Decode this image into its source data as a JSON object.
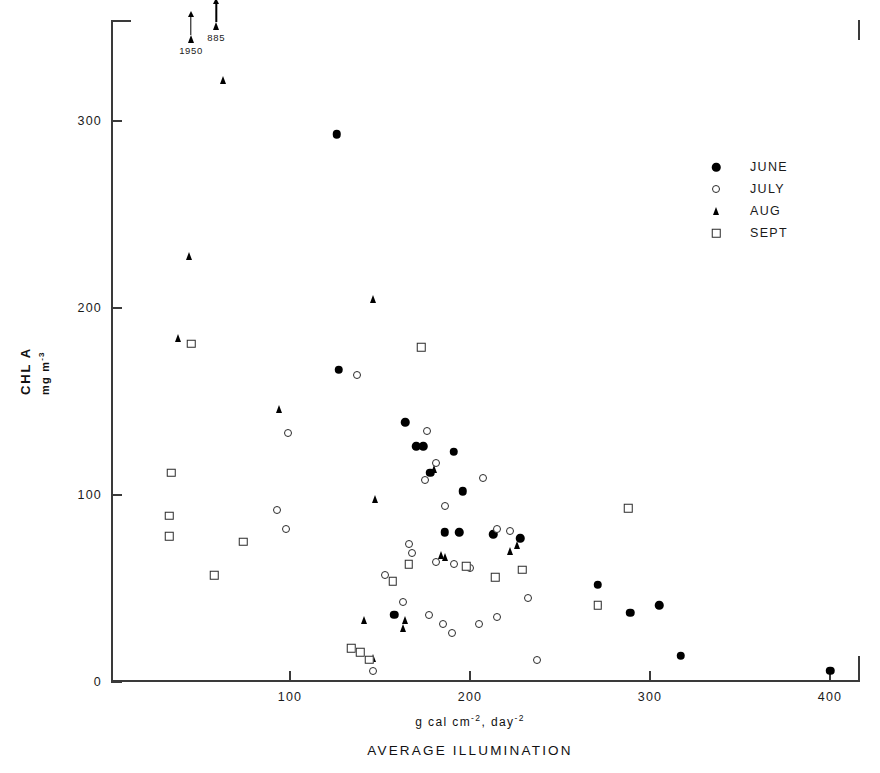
{
  "chart_data": {
    "type": "scatter",
    "title": "AVERAGE ILLUMINATION",
    "xlabel": "g cal cm-2, day-2",
    "xlabel_parts": {
      "prefix": "g  cal  cm",
      "sup1": "-2",
      "mid": ",  day",
      "sup2": "-2"
    },
    "ylabel": "CHL A",
    "ylabel_sub": "mg m-3",
    "ylabel_sub_parts": {
      "prefix": "mg  m",
      "sup": "-3"
    },
    "xlim": [
      0,
      416
    ],
    "ylim": [
      0,
      354
    ],
    "xticks": [
      100,
      200,
      300,
      400
    ],
    "yticks": [
      0,
      100,
      200,
      300
    ],
    "grid": false,
    "legend_position": "upper-right-inside",
    "series": [
      {
        "name": "JUNE",
        "marker": "filled-circle",
        "color": "#000000",
        "points": [
          [
            126,
            293
          ],
          [
            127,
            167
          ],
          [
            164,
            139
          ],
          [
            170,
            126
          ],
          [
            174,
            126
          ],
          [
            178,
            112
          ],
          [
            191,
            123
          ],
          [
            196,
            102
          ],
          [
            186,
            80
          ],
          [
            194,
            80
          ],
          [
            213,
            79
          ],
          [
            228,
            77
          ],
          [
            158,
            36
          ],
          [
            271,
            52
          ],
          [
            289,
            37
          ],
          [
            305,
            41
          ],
          [
            317,
            14
          ],
          [
            400,
            6
          ]
        ]
      },
      {
        "name": "JULY",
        "marker": "open-circle",
        "color": "#2b2b2b",
        "points": [
          [
            137,
            164
          ],
          [
            99,
            133
          ],
          [
            93,
            92
          ],
          [
            98,
            82
          ],
          [
            176,
            134
          ],
          [
            181,
            117
          ],
          [
            175,
            108
          ],
          [
            186,
            94
          ],
          [
            207,
            109
          ],
          [
            166,
            74
          ],
          [
            168,
            69
          ],
          [
            181,
            64
          ],
          [
            191,
            63
          ],
          [
            200,
            61
          ],
          [
            215,
            82
          ],
          [
            222,
            81
          ],
          [
            232,
            45
          ],
          [
            153,
            57
          ],
          [
            163,
            43
          ],
          [
            177,
            36
          ],
          [
            185,
            31
          ],
          [
            190,
            26
          ],
          [
            205,
            31
          ],
          [
            215,
            35
          ],
          [
            237,
            12
          ],
          [
            146,
            6
          ],
          [
            271,
            41
          ]
        ]
      },
      {
        "name": "AUG",
        "marker": "filled-triangle",
        "color": "#000000",
        "points": [
          [
            63,
            322
          ],
          [
            44,
            228
          ],
          [
            38,
            184
          ],
          [
            146,
            205
          ],
          [
            94,
            146
          ],
          [
            180,
            114
          ],
          [
            147,
            98
          ],
          [
            184,
            68
          ],
          [
            186,
            67
          ],
          [
            226,
            73
          ],
          [
            222,
            70
          ],
          [
            164,
            33
          ],
          [
            163,
            29
          ],
          [
            146,
            13
          ],
          [
            141,
            33
          ]
        ]
      },
      {
        "name": "SEPT",
        "marker": "open-square",
        "color": "#2b2b2b",
        "points": [
          [
            45,
            181
          ],
          [
            34,
            112
          ],
          [
            33,
            89
          ],
          [
            33,
            78
          ],
          [
            58,
            57
          ],
          [
            74,
            75
          ],
          [
            173,
            179
          ],
          [
            166,
            63
          ],
          [
            198,
            62
          ],
          [
            157,
            54
          ],
          [
            134,
            18
          ],
          [
            139,
            16
          ],
          [
            144,
            12
          ],
          [
            214,
            56
          ],
          [
            229,
            60
          ],
          [
            288,
            93
          ],
          [
            271,
            41
          ]
        ]
      }
    ],
    "annotations": [
      {
        "label": "1950",
        "x": 45,
        "y_at_axis": 345,
        "series": "AUG",
        "note": "off-scale, arrow up"
      },
      {
        "label": "885",
        "x": 59,
        "y_at_axis": 352,
        "series": "AUG",
        "note": "off-scale, arrow up"
      }
    ]
  },
  "legend": {
    "items": [
      {
        "label": "JUNE",
        "marker": "filled-circle"
      },
      {
        "label": "JULY",
        "marker": "open-circle"
      },
      {
        "label": "AUG",
        "marker": "filled-triangle"
      },
      {
        "label": "SEPT",
        "marker": "open-square"
      }
    ]
  }
}
